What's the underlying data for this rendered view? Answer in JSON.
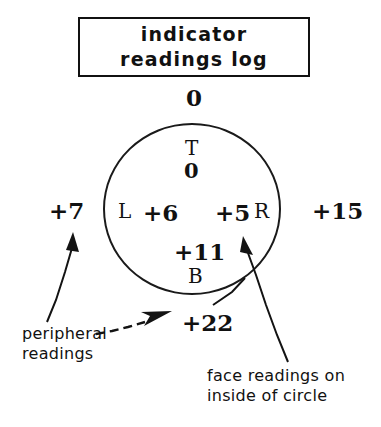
{
  "title": {
    "line1": "indicator",
    "line2": "readings log"
  },
  "diagram": {
    "shape": "circle",
    "peripheral_readings": {
      "top": "0",
      "left": "+7",
      "right": "+15",
      "bottom": "+22"
    },
    "face_readings": [
      {
        "position": "top",
        "letter": "T",
        "value": "0"
      },
      {
        "position": "left",
        "letter": "L",
        "value": "+6"
      },
      {
        "position": "right",
        "letter": "R",
        "value": "+5"
      },
      {
        "position": "bottom",
        "letter": "B",
        "value": "+11"
      }
    ]
  },
  "annotations": {
    "peripheral": {
      "line1": "peripheral",
      "line2": "readings"
    },
    "face": {
      "line1": "face readings on",
      "line2": "inside of circle"
    }
  },
  "colors": {
    "ink": "#111111",
    "paper": "#ffffff"
  }
}
